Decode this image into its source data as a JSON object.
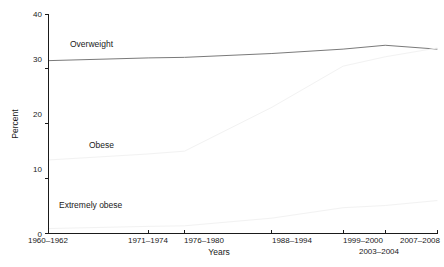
{
  "chart_data": {
    "type": "line",
    "title": "",
    "subtitle": "",
    "xlabel": "Years",
    "ylabel": "Percent",
    "xlim": [
      0,
      6
    ],
    "ylim": [
      0,
      40
    ],
    "grid": false,
    "legend_position": "inline-labels",
    "background_color": "#ffffff",
    "categories": [
      "1960–1962",
      "1971–1974",
      "1976–1980",
      "1988–1994",
      "1999–2000",
      "2003–2004",
      "2007–2008"
    ],
    "x_positions": [
      0,
      1.55,
      2.1,
      3.45,
      4.55,
      5.2,
      6.0
    ],
    "y_ticks": [
      0,
      10,
      20,
      30,
      40
    ],
    "series": [
      {
        "name": "Overweight",
        "color": "#7a7a7a",
        "values": [
          31.5,
          32.0,
          32.1,
          32.8,
          33.6,
          34.3,
          33.6
        ],
        "label_x_value": 0.55,
        "label_y_value": 35.2
      },
      {
        "name": "Obese",
        "color": "#f2f2f2",
        "values": [
          13.4,
          14.5,
          15.0,
          23.0,
          30.5,
          32.2,
          33.8
        ],
        "label_x_value": 0.72,
        "label_y_value": 16.0
      },
      {
        "name": "Extremely obese",
        "color": "#f2f2f2",
        "values": [
          0.9,
          1.3,
          1.4,
          2.8,
          4.7,
          5.1,
          6.0
        ],
        "label_x_value": 0.55,
        "label_y_value": 3.6
      }
    ],
    "x_tick_label_rows": [
      {
        "row": 0,
        "labels": [
          {
            "text": "1960–1962",
            "x_value": 0.0
          },
          {
            "text": "1971–1974",
            "x_value": 1.55
          },
          {
            "text": "1976–1980",
            "x_value": 2.1
          },
          {
            "text": "1988–1994",
            "x_value": 3.45
          },
          {
            "text": "1999–2000",
            "x_value": 4.55
          },
          {
            "text": "2007–2008",
            "x_value": 6.0
          }
        ]
      },
      {
        "row": 1,
        "labels": [
          {
            "text": "2003–2004",
            "x_value": 5.2
          }
        ]
      }
    ]
  },
  "axes": {
    "y_axis_title": "Percent",
    "x_axis_title": "Years",
    "y_tick_labels": [
      "0",
      "10",
      "20",
      "30",
      "40"
    ]
  },
  "series_labels": {
    "overweight": "Overweight",
    "obese": "Obese",
    "extremely_obese": "Extremely obese"
  },
  "x_tick_labels": {
    "t0": "1960–1962",
    "t1": "1971–1974",
    "t2": "1976–1980",
    "t3": "1988–1994",
    "t4": "1999–2000",
    "t5": "2003–2004",
    "t6": "2007–2008"
  },
  "y_tick_labels": {
    "y0": "0",
    "y10": "10",
    "y20": "20",
    "y30": "30",
    "y40": "40"
  }
}
